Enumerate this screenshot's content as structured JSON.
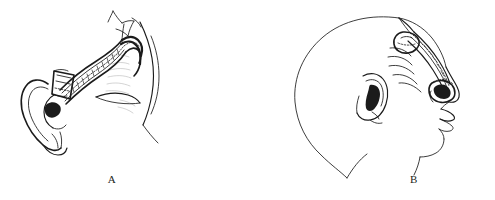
{
  "figure": {
    "background_color": "#ffffff",
    "ink_color": "#1b1b1b",
    "width": 495,
    "height": 200
  },
  "panels": [
    {
      "id": "A",
      "caption": "A",
      "description": "Lateral view of the head showing an elevated tubed pedicle flap arising above the auricle and curving forward over the temporal region; the flap is raised off the scalp and its distal end is inset near the ear.",
      "elements": [
        {
          "name": "auricle",
          "label": "ear"
        },
        {
          "name": "flap-pedicle",
          "label": "tubed pedicle flap"
        },
        {
          "name": "flap-distal-end",
          "label": "flap distal end"
        },
        {
          "name": "scalp-hairline",
          "label": "hairline"
        },
        {
          "name": "face-profile",
          "label": "face profile"
        },
        {
          "name": "defect-site",
          "label": "recipient defect"
        }
      ]
    },
    {
      "id": "B",
      "caption": "B",
      "description": "Lateral profile of a shaved head showing the flap transposed anteriorly from the vertex along the temporal region down to the periorbital / eye socket area, with suture markings along its course.",
      "elements": [
        {
          "name": "head-outline",
          "label": "head outline"
        },
        {
          "name": "auricle",
          "label": "ear"
        },
        {
          "name": "flap-course",
          "label": "transposed flap"
        },
        {
          "name": "orbit-inset",
          "label": "orbital inset site"
        },
        {
          "name": "nose",
          "label": "nose"
        },
        {
          "name": "lips",
          "label": "lips"
        },
        {
          "name": "chin-neck",
          "label": "chin and neck"
        }
      ]
    }
  ],
  "captions": {
    "a": "A",
    "b": "B"
  }
}
